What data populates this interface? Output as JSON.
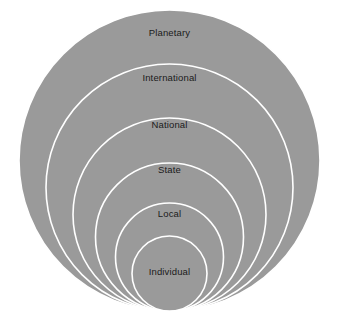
{
  "diagram": {
    "type": "nested-circles",
    "canvas": {
      "width": 339,
      "height": 325
    },
    "colors": {
      "background": "#ffffff",
      "circle_fill": "#9a9a9a",
      "circle_stroke": "#ffffff",
      "label_text": "#1a1a1a"
    },
    "geometry": {
      "center_x": 169.5,
      "bottom_tangent_y": 311,
      "stroke_width": 1.6
    },
    "levels": [
      {
        "label": "Planetary",
        "order": 1,
        "scope": "outermost",
        "diameter": 301,
        "radius": 150.5,
        "cx": 169.5,
        "cy": 160.5,
        "label_x": 169.5,
        "label_y": 33
      },
      {
        "label": "International",
        "order": 2,
        "scope": "second",
        "diameter": 247,
        "radius": 123.5,
        "cx": 169.5,
        "cy": 187.5,
        "label_x": 169.5,
        "label_y": 78
      },
      {
        "label": "National",
        "order": 3,
        "scope": "third",
        "diameter": 193,
        "radius": 96.5,
        "cx": 169.5,
        "cy": 214.5,
        "label_x": 169.5,
        "label_y": 125
      },
      {
        "label": "State",
        "order": 4,
        "scope": "fourth",
        "diameter": 148,
        "radius": 74,
        "cx": 169.5,
        "cy": 237,
        "label_x": 169.5,
        "label_y": 170
      },
      {
        "label": "Local",
        "order": 5,
        "scope": "fifth",
        "diameter": 108,
        "radius": 54,
        "cx": 169.5,
        "cy": 257,
        "label_x": 169.5,
        "label_y": 214
      },
      {
        "label": "Individual",
        "order": 6,
        "scope": "innermost",
        "diameter": 75,
        "radius": 37.5,
        "cx": 169.5,
        "cy": 273.5,
        "label_x": 169.5,
        "label_y": 272
      }
    ]
  }
}
